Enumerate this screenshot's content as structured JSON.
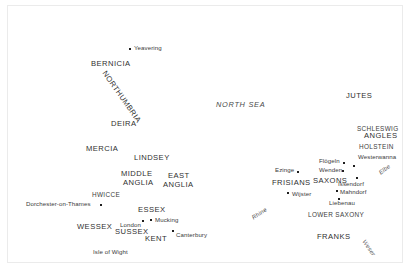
{
  "map": {
    "title": "Map of Anglo-Saxon England and the continental homelands",
    "background_color": "#ffffff",
    "border_color": "#ebebeb",
    "text_color": "#3a3a3a",
    "marker_color": "#1f1f1f",
    "water_features": [
      {
        "name": "NORTH SEA",
        "x": 215,
        "y": 104,
        "rotate": 0,
        "style": "sea"
      },
      {
        "name": "Rhine",
        "x": 252,
        "y": 216,
        "rotate": -34,
        "style": "river"
      },
      {
        "name": "Elbe",
        "x": 379,
        "y": 172,
        "rotate": -37,
        "style": "river"
      },
      {
        "name": "Weser",
        "x": 362,
        "y": 238,
        "rotate": 55,
        "style": "river"
      }
    ],
    "regions_britain": [
      {
        "name": "BERNICIA",
        "x": 90,
        "y": 60,
        "rotate": 0,
        "size": "lg"
      },
      {
        "name": "NORTHUMBRIA",
        "x": 103,
        "y": 66,
        "rotate": 55,
        "size": "lg"
      },
      {
        "name": "DEIRA",
        "x": 110,
        "y": 120,
        "rotate": 0,
        "size": "lg"
      },
      {
        "name": "MERCIA",
        "x": 85,
        "y": 145,
        "rotate": 0,
        "size": "lg"
      },
      {
        "name": "LINDSEY",
        "x": 133,
        "y": 154,
        "rotate": 0,
        "size": "lg"
      },
      {
        "name": "MIDDLE",
        "x": 120,
        "y": 170,
        "rotate": 0,
        "size": "lg"
      },
      {
        "name": "ANGLIA",
        "x": 122,
        "y": 179,
        "rotate": 0,
        "size": "lg"
      },
      {
        "name": "EAST",
        "x": 165,
        "y": 172,
        "rotate": 0,
        "size": "lg"
      },
      {
        "name": "ANGLIA",
        "x": 160,
        "y": 181,
        "rotate": 0,
        "size": "lg"
      },
      {
        "name": "HWICCE",
        "x": 90,
        "y": 191,
        "rotate": 0,
        "size": "sm"
      },
      {
        "name": "ESSEX",
        "x": 137,
        "y": 206,
        "rotate": 0,
        "size": "lg"
      },
      {
        "name": "WESSEX",
        "x": 76,
        "y": 223,
        "rotate": 0,
        "size": "lg"
      },
      {
        "name": "SUSSEX",
        "x": 114,
        "y": 228,
        "rotate": 0,
        "size": "lg"
      },
      {
        "name": "KENT",
        "x": 144,
        "y": 235,
        "rotate": 0,
        "size": "lg"
      }
    ],
    "regions_continent": [
      {
        "name": "JUTES",
        "x": 344,
        "y": 92,
        "rotate": 0,
        "size": "lg"
      },
      {
        "name": "SCHLESWIG",
        "x": 355,
        "y": 125,
        "rotate": 0,
        "size": "sm"
      },
      {
        "name": "ANGLES",
        "x": 362,
        "y": 132,
        "rotate": 0,
        "size": "lg"
      },
      {
        "name": "HOLSTEIN",
        "x": 357,
        "y": 143,
        "rotate": 0,
        "size": "sm"
      },
      {
        "name": "FRISIANS",
        "x": 270,
        "y": 179,
        "rotate": 0,
        "size": "lg"
      },
      {
        "name": "SAXONS",
        "x": 312,
        "y": 177,
        "rotate": 0,
        "size": "lg"
      },
      {
        "name": "LOWER SAXONY",
        "x": 306,
        "y": 211,
        "rotate": 0,
        "size": "sm"
      },
      {
        "name": "FRANKS",
        "x": 316,
        "y": 233,
        "rotate": 0,
        "size": "lg"
      }
    ],
    "sites_britain": [
      {
        "name": "Yeavering",
        "x": 128,
        "y": 44,
        "marker_x": 121,
        "marker_y": 43
      },
      {
        "name": "Dorchester-on-Thames",
        "x": 25,
        "y": 200,
        "marker_x": 92,
        "marker_y": 199
      },
      {
        "name": "London",
        "x": 112,
        "y": 219,
        "marker_x": 134,
        "marker_y": 216
      },
      {
        "name": "Mucking",
        "x": 148,
        "y": 215,
        "marker_x": 142,
        "marker_y": 214
      },
      {
        "name": "Canterbury",
        "x": 168,
        "y": 228,
        "marker_x": 164,
        "marker_y": 226
      }
    ],
    "sites_continent": [
      {
        "name": "Ezinge",
        "x": 268,
        "y": 164,
        "marker_x": 289,
        "marker_y": 166
      },
      {
        "name": "Flögeln",
        "x": 313,
        "y": 156,
        "marker_x": 335,
        "marker_y": 157
      },
      {
        "name": "Westerwanna",
        "x": 354,
        "y": 152,
        "marker_x": 345,
        "marker_y": 160
      },
      {
        "name": "Wenden",
        "x": 313,
        "y": 164,
        "marker_x": 334,
        "marker_y": 165
      },
      {
        "name": "Issendorf",
        "x": 332,
        "y": 178,
        "marker_x": 348,
        "marker_y": 172
      },
      {
        "name": "Mahndorf",
        "x": 332,
        "y": 187,
        "marker_x": 328,
        "marker_y": 185
      },
      {
        "name": "Wijster",
        "x": 285,
        "y": 188,
        "marker_x": 279,
        "marker_y": 187
      },
      {
        "name": "Liebenau",
        "x": 323,
        "y": 197,
        "marker_x": 330,
        "marker_y": 193
      }
    ],
    "islands": [
      {
        "name": "Isle of Wight",
        "x": 89,
        "y": 246
      }
    ]
  }
}
